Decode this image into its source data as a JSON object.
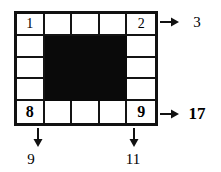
{
  "puzzle": {
    "type": "grid-sum-puzzle",
    "rows": 5,
    "cols": 5,
    "filled_region": {
      "row_start": 2,
      "row_end": 4,
      "col_start": 2,
      "col_end": 4,
      "color": "#0a0a0a"
    },
    "cells": [
      {
        "row": 1,
        "col": 1,
        "value": "1",
        "bold": false,
        "filled": false
      },
      {
        "row": 1,
        "col": 2,
        "value": "",
        "bold": false,
        "filled": false
      },
      {
        "row": 1,
        "col": 3,
        "value": "",
        "bold": false,
        "filled": false
      },
      {
        "row": 1,
        "col": 4,
        "value": "",
        "bold": false,
        "filled": false
      },
      {
        "row": 1,
        "col": 5,
        "value": "2",
        "bold": false,
        "filled": false
      },
      {
        "row": 2,
        "col": 1,
        "value": "",
        "bold": false,
        "filled": false
      },
      {
        "row": 2,
        "col": 2,
        "value": "",
        "bold": false,
        "filled": true
      },
      {
        "row": 2,
        "col": 3,
        "value": "",
        "bold": false,
        "filled": true
      },
      {
        "row": 2,
        "col": 4,
        "value": "",
        "bold": false,
        "filled": true
      },
      {
        "row": 2,
        "col": 5,
        "value": "",
        "bold": false,
        "filled": false
      },
      {
        "row": 3,
        "col": 1,
        "value": "",
        "bold": false,
        "filled": false
      },
      {
        "row": 3,
        "col": 2,
        "value": "",
        "bold": false,
        "filled": true
      },
      {
        "row": 3,
        "col": 3,
        "value": "",
        "bold": false,
        "filled": true
      },
      {
        "row": 3,
        "col": 4,
        "value": "",
        "bold": false,
        "filled": true
      },
      {
        "row": 3,
        "col": 5,
        "value": "",
        "bold": false,
        "filled": false
      },
      {
        "row": 4,
        "col": 1,
        "value": "",
        "bold": false,
        "filled": false
      },
      {
        "row": 4,
        "col": 2,
        "value": "",
        "bold": false,
        "filled": true
      },
      {
        "row": 4,
        "col": 3,
        "value": "",
        "bold": false,
        "filled": true
      },
      {
        "row": 4,
        "col": 4,
        "value": "",
        "bold": false,
        "filled": true
      },
      {
        "row": 4,
        "col": 5,
        "value": "",
        "bold": false,
        "filled": false
      },
      {
        "row": 5,
        "col": 1,
        "value": "8",
        "bold": true,
        "filled": false
      },
      {
        "row": 5,
        "col": 2,
        "value": "",
        "bold": false,
        "filled": false
      },
      {
        "row": 5,
        "col": 3,
        "value": "",
        "bold": false,
        "filled": false
      },
      {
        "row": 5,
        "col": 4,
        "value": "",
        "bold": false,
        "filled": false
      },
      {
        "row": 5,
        "col": 5,
        "value": "9",
        "bold": true,
        "filled": false
      }
    ],
    "annotations": {
      "row1_sum": {
        "label": "3",
        "bold": false,
        "arrow": "right"
      },
      "row5_sum": {
        "label": "17",
        "bold": true,
        "arrow": "right"
      },
      "col1_sum": {
        "label": "9",
        "bold": false,
        "arrow": "down"
      },
      "col5_sum": {
        "label": "11",
        "bold": false,
        "arrow": "down"
      }
    },
    "icons": {
      "arrow_right": "arrow-right-icon",
      "arrow_down": "arrow-down-icon"
    }
  }
}
